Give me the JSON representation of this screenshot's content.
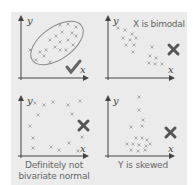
{
  "diagram": {
    "background": "#ebebeb",
    "axis_color": "#444444",
    "point_color": "#999999",
    "mark_color": "#555555",
    "panels": [
      {
        "id": "top-left",
        "x_label": "x",
        "y_label": "y",
        "caption": "",
        "verdict": "check",
        "verdict_glyph": "✔",
        "shape": "ellipse"
      },
      {
        "id": "top-right",
        "x_label": "x",
        "y_label": "y",
        "caption": "X is bimodal",
        "verdict": "cross",
        "verdict_glyph": "✖"
      },
      {
        "id": "bottom-left",
        "x_label": "x",
        "y_label": "y",
        "caption_lines": [
          "Definitely not",
          "bivariate normal"
        ],
        "verdict": "cross",
        "verdict_glyph": "✖"
      },
      {
        "id": "bottom-right",
        "x_label": "x",
        "y_label": "y",
        "caption": "Y is skewed",
        "verdict": "cross",
        "verdict_glyph": "✖"
      }
    ]
  }
}
